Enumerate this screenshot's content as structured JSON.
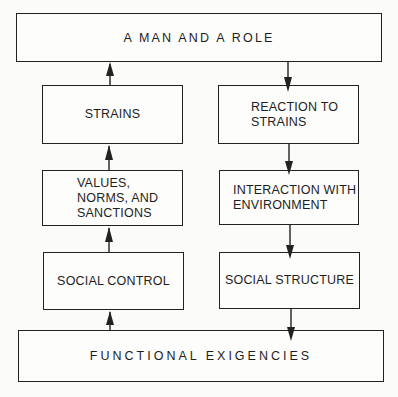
{
  "diagram": {
    "top": {
      "label": "A MAN AND A ROLE"
    },
    "bottom": {
      "label": "FUNCTIONAL EXIGENCIES"
    },
    "left_column": [
      {
        "label": "STRAINS"
      },
      {
        "label": "VALUES,\nNORMS, AND\nSANCTIONS"
      },
      {
        "label": "SOCIAL CONTROL"
      }
    ],
    "right_column": [
      {
        "label": "REACTION TO\nSTRAINS"
      },
      {
        "label": "INTERACTION WITH\nENVIRONMENT"
      },
      {
        "label": "SOCIAL STRUCTURE"
      }
    ],
    "flows": [
      {
        "from": "FUNCTIONAL EXIGENCIES",
        "to": "SOCIAL CONTROL",
        "direction": "up"
      },
      {
        "from": "SOCIAL CONTROL",
        "to": "VALUES, NORMS, AND SANCTIONS",
        "direction": "up"
      },
      {
        "from": "VALUES, NORMS, AND SANCTIONS",
        "to": "STRAINS",
        "direction": "up"
      },
      {
        "from": "STRAINS",
        "to": "A MAN AND A ROLE",
        "direction": "up"
      },
      {
        "from": "A MAN AND A ROLE",
        "to": "REACTION TO STRAINS",
        "direction": "down"
      },
      {
        "from": "REACTION TO STRAINS",
        "to": "INTERACTION WITH ENVIRONMENT",
        "direction": "down"
      },
      {
        "from": "INTERACTION WITH ENVIRONMENT",
        "to": "SOCIAL STRUCTURE",
        "direction": "down"
      },
      {
        "from": "SOCIAL STRUCTURE",
        "to": "FUNCTIONAL EXIGENCIES",
        "direction": "down"
      }
    ]
  }
}
